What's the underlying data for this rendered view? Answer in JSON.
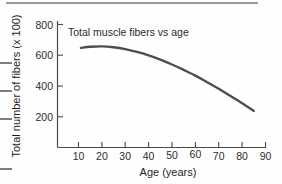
{
  "figure": {
    "background_color": "#fefefe",
    "artifacts": {
      "top_rule": "page-edge-rule",
      "left_rules": "page-edge-rule"
    }
  },
  "chart_data": {
    "type": "line",
    "title": "Total muscle fibers vs age",
    "xlabel": "Age (years)",
    "ylabel": "Total number of fibers (x 100)",
    "xlim": [
      5,
      92
    ],
    "ylim": [
      0,
      860
    ],
    "xticks": [
      10,
      20,
      30,
      40,
      50,
      60,
      70,
      80,
      90
    ],
    "xtick_labels": [
      "10",
      "20",
      "30",
      "40",
      "50",
      "60",
      "70",
      "80",
      "90"
    ],
    "yticks": [
      200,
      400,
      600,
      800
    ],
    "ytick_labels": [
      "200",
      "400",
      "600",
      "800"
    ],
    "grid": false,
    "legend": false,
    "line_color": "#4e4e4e",
    "series": [
      {
        "name": "Total muscle fibers",
        "x": [
          11,
          15,
          20,
          25,
          30,
          35,
          40,
          45,
          50,
          55,
          60,
          65,
          70,
          75,
          80,
          85
        ],
        "values": [
          648,
          655,
          658,
          652,
          640,
          622,
          600,
          572,
          540,
          505,
          468,
          425,
          382,
          335,
          288,
          238
        ]
      }
    ]
  }
}
